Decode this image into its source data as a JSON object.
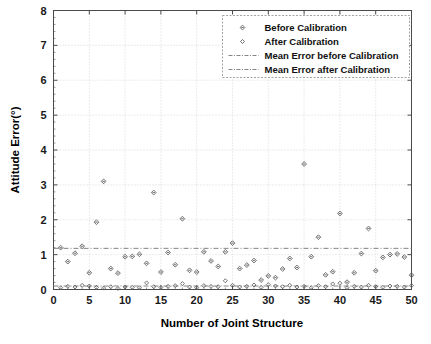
{
  "chart_data": {
    "type": "scatter",
    "title": "",
    "xlabel": "Number of Joint Structure",
    "ylabel": "Attitude Error(°)",
    "xlim": [
      0,
      50
    ],
    "ylim": [
      0,
      8
    ],
    "xticks": [
      0,
      5,
      10,
      15,
      20,
      25,
      30,
      35,
      40,
      45,
      50
    ],
    "yticks": [
      0,
      1,
      2,
      3,
      4,
      5,
      6,
      7,
      8
    ],
    "xtick_labels": [
      "0",
      "5",
      "10",
      "15",
      "20",
      "25",
      "30",
      "35",
      "40",
      "45",
      "50"
    ],
    "ytick_labels": [
      "0",
      "1",
      "2",
      "3",
      "4",
      "5",
      "6",
      "7",
      "8"
    ],
    "grid": true,
    "legend_position": "upper right",
    "series": [
      {
        "name": "Before Calibration",
        "marker": "diamond",
        "x": [
          1,
          2,
          3,
          4,
          5,
          6,
          7,
          8,
          9,
          10,
          11,
          12,
          13,
          14,
          15,
          16,
          17,
          18,
          19,
          20,
          21,
          22,
          23,
          24,
          25,
          26,
          27,
          28,
          29,
          30,
          31,
          32,
          33,
          34,
          35,
          36,
          37,
          38,
          39,
          40,
          41,
          42,
          43,
          44,
          45,
          46,
          47,
          48,
          49,
          50
        ],
        "values": [
          1.2,
          0.8,
          1.04,
          1.24,
          0.48,
          1.93,
          3.1,
          0.6,
          0.47,
          0.94,
          0.95,
          1.01,
          0.75,
          2.78,
          0.5,
          1.06,
          0.71,
          2.03,
          0.55,
          0.5,
          1.08,
          0.82,
          0.66,
          1.08,
          1.33,
          0.6,
          0.7,
          0.83,
          0.27,
          0.39,
          0.34,
          0.59,
          0.89,
          0.63,
          3.6,
          0.94,
          1.5,
          0.42,
          0.51,
          2.18,
          0.21,
          0.48,
          1.03,
          1.75,
          0.54,
          0.92,
          1.0,
          1.02,
          0.93,
          0.41
        ]
      },
      {
        "name": "After Calibration",
        "marker": "diamond-small",
        "x": [
          1,
          2,
          3,
          4,
          5,
          6,
          7,
          8,
          9,
          10,
          11,
          12,
          13,
          14,
          15,
          16,
          17,
          18,
          19,
          20,
          21,
          22,
          23,
          24,
          25,
          26,
          27,
          28,
          29,
          30,
          31,
          32,
          33,
          34,
          35,
          36,
          37,
          38,
          39,
          40,
          41,
          42,
          43,
          44,
          45,
          46,
          47,
          48,
          49,
          50
        ],
        "values": [
          0.05,
          0.09,
          0.07,
          0.12,
          0.1,
          0.06,
          0.04,
          0.08,
          0.03,
          0.07,
          0.06,
          0.05,
          0.19,
          0.08,
          0.06,
          0.09,
          0.11,
          0.17,
          0.07,
          0.05,
          0.11,
          0.09,
          0.08,
          0.25,
          0.12,
          0.07,
          0.09,
          0.13,
          0.06,
          0.14,
          0.1,
          0.08,
          0.12,
          0.07,
          0.09,
          0.05,
          0.11,
          0.08,
          0.16,
          0.18,
          0.05,
          0.09,
          0.07,
          0.12,
          0.08,
          0.06,
          0.1,
          0.09,
          0.07,
          0.11
        ]
      }
    ],
    "reference_lines": [
      {
        "name": "Mean Error before Calibration",
        "value": 1.18,
        "style": "dash-dot"
      },
      {
        "name": "Mean Error after Calibration",
        "value": 0.1,
        "style": "dash-dot"
      }
    ]
  },
  "legend": {
    "entries": [
      {
        "label": "Before Calibration",
        "kind": "marker"
      },
      {
        "label": "After Calibration",
        "kind": "marker"
      },
      {
        "label": "Mean Error before Calibration",
        "kind": "line"
      },
      {
        "label": "Mean Error after Calibration",
        "kind": "line"
      }
    ]
  },
  "colors": {
    "axis": "#4a4a4a",
    "grid": "#c9c9c9",
    "marker": "#5a5a5a",
    "mean_line": "#777777",
    "background": "#ffffff"
  }
}
